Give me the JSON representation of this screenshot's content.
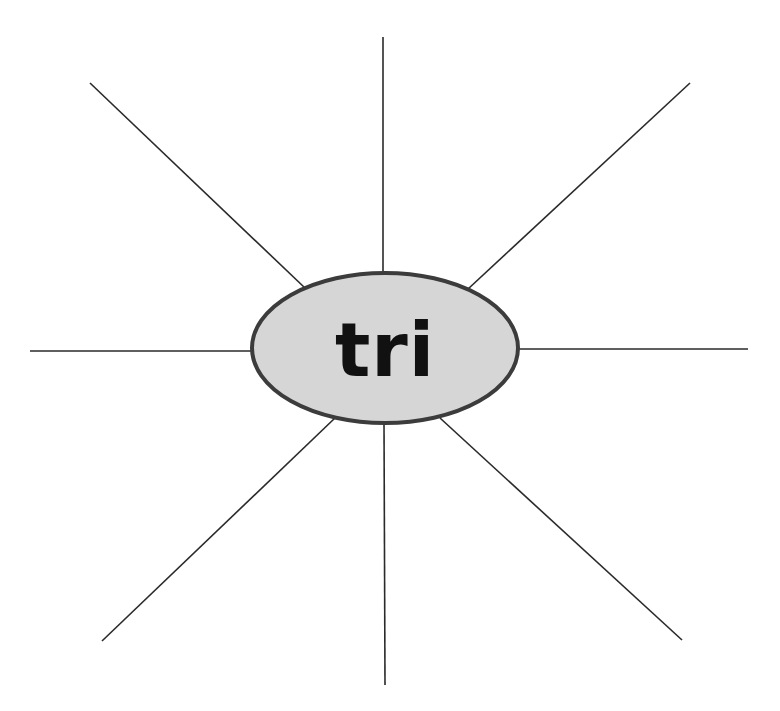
{
  "diagram": {
    "type": "word-web",
    "center": {
      "label": "tri",
      "cx": 385,
      "cy": 348,
      "rx": 133,
      "ry": 75,
      "fill": "#d6d6d6",
      "stroke": "#3c3c3c"
    },
    "spokes": [
      {
        "id": "top",
        "x1": 383,
        "y1": 37,
        "x2": 383,
        "y2": 273
      },
      {
        "id": "top-left",
        "x1": 90,
        "y1": 83,
        "x2": 305,
        "y2": 288
      },
      {
        "id": "top-right",
        "x1": 690,
        "y1": 83,
        "x2": 468,
        "y2": 289
      },
      {
        "id": "left",
        "x1": 30,
        "y1": 351,
        "x2": 252,
        "y2": 351
      },
      {
        "id": "right",
        "x1": 748,
        "y1": 349,
        "x2": 518,
        "y2": 349
      },
      {
        "id": "bottom-left",
        "x1": 102,
        "y1": 641,
        "x2": 335,
        "y2": 418
      },
      {
        "id": "bottom",
        "x1": 384,
        "y1": 422,
        "x2": 385,
        "y2": 685
      },
      {
        "id": "bottom-right",
        "x1": 682,
        "y1": 640,
        "x2": 440,
        "y2": 418
      }
    ],
    "spoke_color": "#2a2a2a"
  }
}
